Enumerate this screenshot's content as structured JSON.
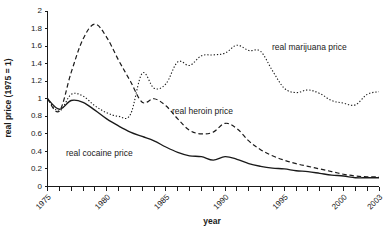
{
  "chart_data": {
    "type": "line",
    "title": "",
    "xlabel": "year",
    "ylabel": "real price (1975 = 1)",
    "xlim": [
      1975,
      2003
    ],
    "ylim": [
      0,
      2
    ],
    "grid": false,
    "legend_position": "inline-annotations",
    "x_tick_labels": [
      "1975",
      "1980",
      "1985",
      "1990",
      "1995",
      "2000",
      "2003"
    ],
    "x_tick_values": [
      1975,
      1980,
      1985,
      1990,
      1995,
      2000,
      2003
    ],
    "y_tick_labels": [
      "0",
      "0.2",
      "0.4",
      "0.6",
      "0.8",
      "1",
      "1.2",
      "1.4",
      "1.6",
      "1.8",
      "2"
    ],
    "y_tick_values": [
      0,
      0.2,
      0.4,
      0.6,
      0.8,
      1,
      1.2,
      1.4,
      1.6,
      1.8,
      2
    ],
    "x": [
      1975,
      1976,
      1977,
      1978,
      1979,
      1980,
      1981,
      1982,
      1983,
      1984,
      1985,
      1986,
      1987,
      1988,
      1989,
      1990,
      1991,
      1992,
      1993,
      1994,
      1995,
      1996,
      1997,
      1998,
      1999,
      2000,
      2001,
      2002,
      2003
    ],
    "series": [
      {
        "name": "real cocaine price",
        "style": "solid",
        "color": "#1a1a1a",
        "annotation": "real cocaine price",
        "values": [
          1.0,
          0.88,
          0.98,
          0.96,
          0.87,
          0.77,
          0.69,
          0.62,
          0.57,
          0.52,
          0.45,
          0.39,
          0.35,
          0.34,
          0.3,
          0.34,
          0.31,
          0.26,
          0.23,
          0.21,
          0.2,
          0.18,
          0.17,
          0.15,
          0.13,
          0.12,
          0.1,
          0.1,
          0.1
        ]
      },
      {
        "name": "real heroin price",
        "style": "dashed",
        "color": "#1a1a1a",
        "annotation": "real heroin price",
        "values": [
          1.0,
          0.86,
          1.3,
          1.68,
          1.85,
          1.7,
          1.44,
          1.2,
          0.96,
          1.0,
          0.92,
          0.77,
          0.64,
          0.6,
          0.62,
          0.72,
          0.66,
          0.52,
          0.42,
          0.35,
          0.3,
          0.26,
          0.23,
          0.2,
          0.17,
          0.14,
          0.12,
          0.11,
          0.11
        ]
      },
      {
        "name": "real marijuana price",
        "style": "dotted",
        "color": "#1a1a1a",
        "annotation": "real marijuana price",
        "values": [
          1.0,
          0.86,
          1.05,
          1.03,
          0.92,
          0.84,
          0.8,
          0.82,
          1.29,
          1.12,
          1.17,
          1.42,
          1.38,
          1.49,
          1.5,
          1.52,
          1.61,
          1.55,
          1.54,
          1.32,
          1.12,
          1.07,
          1.1,
          1.06,
          0.98,
          0.95,
          0.93,
          1.05,
          1.08
        ]
      }
    ]
  },
  "annotations": {
    "marijuana_label": "real marijuana price",
    "heroin_label": "real heroin price",
    "cocaine_label": "real cocaine price"
  },
  "axes": {
    "x_title": "year",
    "y_title": "real price (1975 = 1)"
  }
}
